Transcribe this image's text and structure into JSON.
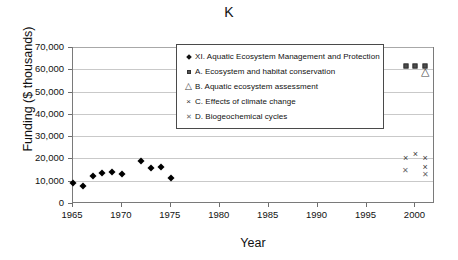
{
  "chart_data": {
    "type": "scatter",
    "title": "K",
    "xlabel": "Year",
    "ylabel": "Funding ($ thousands)",
    "xlim": [
      1965,
      2002
    ],
    "ylim": [
      0,
      70000
    ],
    "xticks": [
      1965,
      1970,
      1975,
      1980,
      1985,
      1990,
      1995,
      2000
    ],
    "xtick_labels": [
      "1965",
      "1970",
      "1975",
      "1980",
      "1985",
      "1990",
      "1995",
      "2000"
    ],
    "yticks": [
      0,
      10000,
      20000,
      30000,
      40000,
      50000,
      60000,
      70000
    ],
    "ytick_labels": [
      "0",
      "10,000",
      "20,000",
      "30,000",
      "40,000",
      "50,000",
      "60,000",
      "70,000"
    ],
    "grid": true,
    "grid_axis": "y",
    "legend_position": "upper-center",
    "series": [
      {
        "name": "XI. Aquatic Ecosystem Management and Protection",
        "marker": "filled-diamond",
        "color": "#000000",
        "points": [
          {
            "x": 1965,
            "y": 9000
          },
          {
            "x": 1966,
            "y": 7600
          },
          {
            "x": 1967,
            "y": 12300
          },
          {
            "x": 1968,
            "y": 13500
          },
          {
            "x": 1969,
            "y": 13700
          },
          {
            "x": 1970,
            "y": 13200
          },
          {
            "x": 1972,
            "y": 18700
          },
          {
            "x": 1973,
            "y": 15600
          },
          {
            "x": 1974,
            "y": 16200
          },
          {
            "x": 1975,
            "y": 11000
          }
        ]
      },
      {
        "name": "A. Ecosystem and habitat conservation",
        "marker": "filled-square",
        "color": "#4d4d4d",
        "points": [
          {
            "x": 1999,
            "y": 61500
          },
          {
            "x": 2000,
            "y": 61500
          },
          {
            "x": 2001,
            "y": 61500
          }
        ]
      },
      {
        "name": "B. Aquatic ecosystem assessment",
        "marker": "open-triangle",
        "color": "#555555",
        "points": [
          {
            "x": 2001,
            "y": 58800
          }
        ]
      },
      {
        "name": "C. Effects of climate change",
        "marker": "x-cross",
        "color": "#3a3a3a",
        "points": [
          {
            "x": 1999,
            "y": 20000
          },
          {
            "x": 2000,
            "y": 22200
          },
          {
            "x": 2001,
            "y": 20100
          },
          {
            "x": 2001,
            "y": 16300
          }
        ]
      },
      {
        "name": "D. Biogeochemical cycles",
        "marker": "x-cross-small",
        "color": "#6a6a6a",
        "points": [
          {
            "x": 1999,
            "y": 14300
          },
          {
            "x": 2001,
            "y": 12600
          }
        ]
      }
    ]
  },
  "legend": {
    "items": [
      {
        "marker": "filled-diamond",
        "label": "XI. Aquatic Ecosystem Management and Protection"
      },
      {
        "marker": "filled-square",
        "label": "A. Ecosystem and habitat conservation"
      },
      {
        "marker": "open-triangle",
        "label": "B. Aquatic ecosystem assessment"
      },
      {
        "marker": "x-cross",
        "label": "C. Effects of climate change"
      },
      {
        "marker": "x-cross-small",
        "label": "D. Biogeochemical cycles"
      }
    ]
  },
  "glyphs": {
    "triangle": "△",
    "x_cross": "×",
    "x_cross_small": "✕"
  }
}
